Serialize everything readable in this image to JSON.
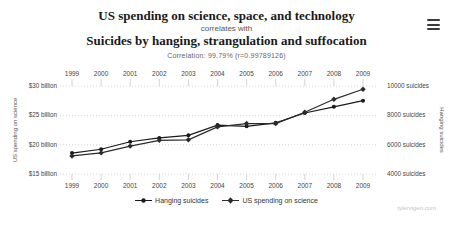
{
  "header": {
    "title_top": "US spending on science, space, and technology",
    "connector": "correlates with",
    "title_bottom": "Suicides by hanging, strangulation and suffocation",
    "correlation": "Correlation: 99.79% (r=0.99789126)"
  },
  "menu": {
    "icon": "hamburger-menu-icon"
  },
  "watermark": "tylervigen.com",
  "colors": {
    "title": "#1a1a1a",
    "muted_text": "#666666",
    "gridline": "#cccccc",
    "tick_label": "#444444",
    "series_suicides": "#1a1a1a",
    "series_spending": "#2b2b2b"
  },
  "chart_data": {
    "type": "line",
    "title": "US spending on science, space, and technology correlates with Suicides by hanging, strangulation and suffocation",
    "x": [
      1999,
      2000,
      2001,
      2002,
      2003,
      2004,
      2005,
      2006,
      2007,
      2008,
      2009
    ],
    "x_axis": {
      "labels_top": true,
      "labels_bottom": true
    },
    "series": [
      {
        "name": "Hanging suicides",
        "axis": "right",
        "marker": "circle",
        "color": "#1a1a1a",
        "values": [
          5427,
          5688,
          6198,
          6462,
          6635,
          7336,
          7248,
          7491,
          8161,
          8578,
          9000
        ]
      },
      {
        "name": "US spending on science",
        "axis": "left",
        "marker": "diamond",
        "color": "#2b2b2b",
        "values": [
          18.079,
          18.594,
          19.753,
          20.734,
          20.831,
          23.029,
          23.597,
          23.584,
          25.525,
          27.731,
          29.449
        ]
      }
    ],
    "left_axis": {
      "label": "US spending on science",
      "range": [
        15,
        30
      ],
      "tick_values": [
        30,
        25,
        20,
        15
      ],
      "tick_labels": [
        "$30 billion",
        "$25 billion",
        "$20 billion",
        "$15 billion"
      ]
    },
    "right_axis": {
      "label": "Hanging suicides",
      "range": [
        4000,
        10000
      ],
      "tick_values": [
        10000,
        8000,
        6000,
        4000
      ],
      "tick_labels": [
        "10000 suicides",
        "8000 suicides",
        "6000 suicides",
        "4000 suicides"
      ]
    },
    "grid": "horizontal-dotted",
    "legend_position": "bottom-center"
  }
}
